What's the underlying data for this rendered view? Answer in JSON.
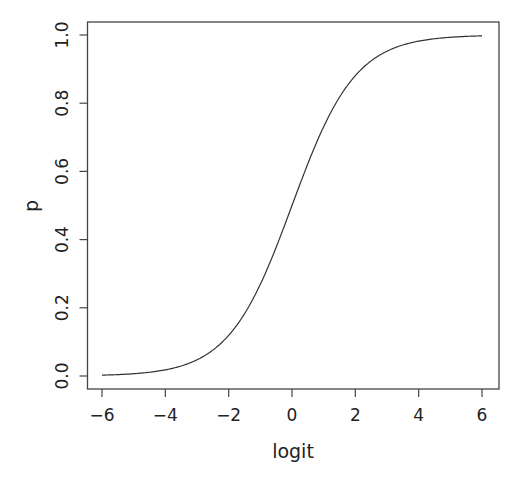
{
  "chart_data": {
    "type": "line",
    "title": "",
    "xlabel": "logit",
    "ylabel": "p",
    "xlim": [
      -6,
      6
    ],
    "ylim": [
      0,
      1
    ],
    "grid": false,
    "legend": null,
    "x_ticks": [
      -6,
      -4,
      -2,
      0,
      2,
      4,
      6
    ],
    "x_tick_labels": [
      "−6",
      "−4",
      "−2",
      "0",
      "2",
      "4",
      "6"
    ],
    "y_ticks": [
      0.0,
      0.2,
      0.4,
      0.6,
      0.8,
      1.0
    ],
    "y_tick_labels": [
      "0.0",
      "0.2",
      "0.4",
      "0.6",
      "0.8",
      "1.0"
    ],
    "series": [
      {
        "name": "inverse logit",
        "function": "p = 1 / (1 + exp(-logit))",
        "x": [
          -6,
          -5,
          -4,
          -3,
          -2,
          -1,
          0,
          1,
          2,
          3,
          4,
          5,
          6
        ],
        "values": [
          0.0025,
          0.0067,
          0.018,
          0.047,
          0.119,
          0.269,
          0.5,
          0.731,
          0.881,
          0.953,
          0.982,
          0.9933,
          0.9975
        ],
        "color": "#333333"
      }
    ]
  }
}
